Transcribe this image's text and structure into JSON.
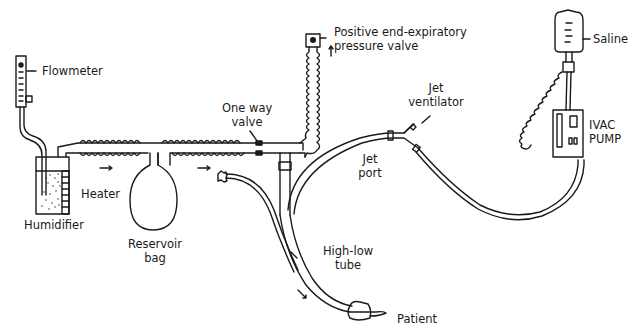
{
  "diagram": {
    "type": "medical-apparatus-schematic",
    "colors": {
      "line": "#1a1a1a",
      "background": "#ffffff"
    },
    "labels": {
      "flowmeter": "Flowmeter",
      "humidifier": "Humidifier",
      "heater": "Heater",
      "reservoir_bag_1": "Reservoir",
      "reservoir_bag_2": "bag",
      "one_way_valve_1": "One way",
      "one_way_valve_2": "valve",
      "peep_valve_1": "Positive end-expiratory",
      "peep_valve_2": "pressure valve",
      "jet_ventilator_1": "Jet",
      "jet_ventilator_2": "ventilator",
      "jet_port_1": "Jet",
      "jet_port_2": "port",
      "high_low_tube_1": "High-low",
      "high_low_tube_2": "tube",
      "patient": "Patient",
      "saline": "Saline",
      "ivac_pump_1": "IVAC",
      "ivac_pump_2": "PUMP"
    },
    "components": [
      "flowmeter",
      "humidifier",
      "heater",
      "reservoir-bag",
      "one-way-valve",
      "positive-end-expiratory-pressure-valve",
      "jet-ventilator",
      "jet-port",
      "high-low-tube",
      "patient",
      "saline-bag",
      "ivac-pump"
    ]
  }
}
